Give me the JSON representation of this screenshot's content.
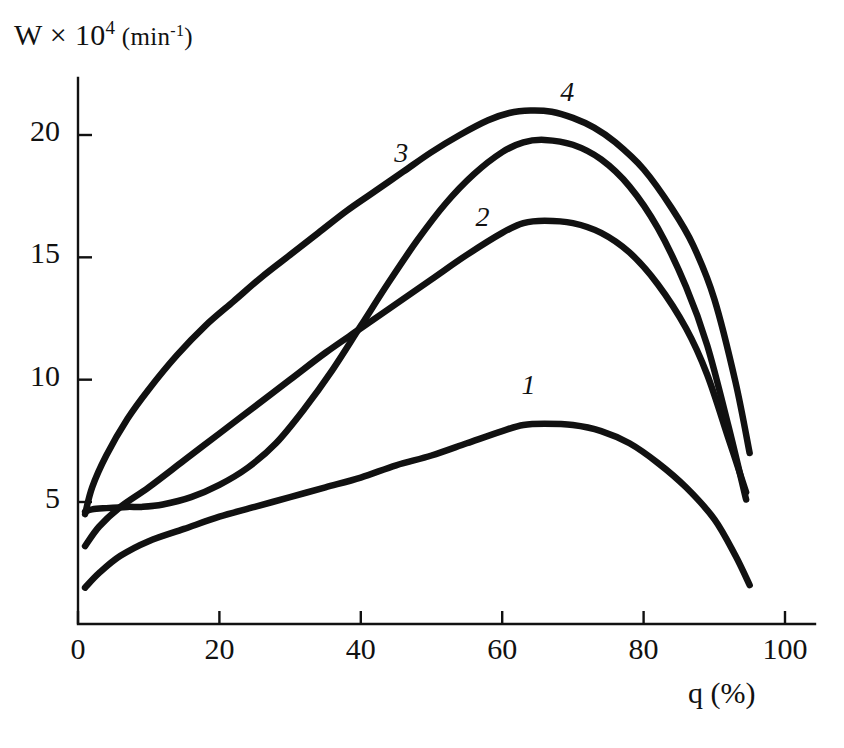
{
  "chart_data": {
    "type": "line",
    "title": "",
    "ylabel": "W x 10^4 (min^-1)",
    "ylabel_parts": {
      "lead": "W × 10",
      "exp": "4",
      "unit_open": " (min",
      "unit_exp": "-1",
      "unit_close": ")"
    },
    "xlabel": "q (%)",
    "xlim": [
      0,
      100
    ],
    "ylim": [
      0,
      22.3
    ],
    "grid": false,
    "legend": "inline-curve-numbers",
    "xticks": [
      0,
      20,
      40,
      60,
      80,
      100
    ],
    "xtick_labels": [
      "0",
      "20",
      "40",
      "60",
      "80",
      "100"
    ],
    "yticks": [
      5,
      10,
      15,
      20
    ],
    "ytick_labels": [
      "5",
      "10",
      "15",
      "20"
    ],
    "series": [
      {
        "name": "1",
        "label": "1",
        "label_x": 64,
        "label_y": 9.6,
        "x": [
          1,
          3,
          6,
          10,
          15,
          20,
          25,
          30,
          35,
          40,
          45,
          50,
          55,
          60,
          63,
          66,
          70,
          74,
          78,
          82,
          86,
          90,
          93,
          95
        ],
        "y": [
          1.5,
          2.1,
          2.8,
          3.4,
          3.9,
          4.4,
          4.8,
          5.2,
          5.6,
          6.0,
          6.5,
          6.9,
          7.4,
          7.9,
          8.15,
          8.2,
          8.15,
          7.9,
          7.4,
          6.6,
          5.6,
          4.3,
          2.8,
          1.6
        ]
      },
      {
        "name": "2",
        "label": "2",
        "label_x": 57.5,
        "label_y": 16.5,
        "x": [
          1,
          3,
          6,
          10,
          15,
          20,
          25,
          30,
          35,
          40,
          45,
          50,
          55,
          60,
          63,
          66,
          70,
          74,
          78,
          82,
          86,
          89,
          92,
          94.5
        ],
        "y": [
          3.2,
          4.0,
          4.8,
          5.6,
          6.7,
          7.8,
          8.9,
          10.0,
          11.1,
          12.1,
          13.1,
          14.1,
          15.1,
          16.0,
          16.4,
          16.5,
          16.4,
          16.0,
          15.2,
          13.9,
          12.1,
          10.2,
          7.6,
          5.4
        ]
      },
      {
        "name": "3",
        "label": "3",
        "label_x": 46,
        "label_y": 19.1,
        "x": [
          1,
          2,
          4,
          7,
          9,
          12,
          16,
          20,
          24,
          28,
          32,
          36,
          40,
          44,
          48,
          52,
          56,
          60,
          63,
          66,
          70,
          74,
          78,
          82,
          86,
          89,
          92,
          94.5
        ],
        "y": [
          4.6,
          4.7,
          4.75,
          4.8,
          4.8,
          4.9,
          5.2,
          5.7,
          6.4,
          7.4,
          8.8,
          10.4,
          12.2,
          14.0,
          15.7,
          17.2,
          18.4,
          19.3,
          19.7,
          19.8,
          19.6,
          19.0,
          17.9,
          16.2,
          13.8,
          11.4,
          8.1,
          5.1
        ]
      },
      {
        "name": "4",
        "label": "4",
        "label_x": 69.5,
        "label_y": 21.6,
        "x": [
          1,
          2,
          4,
          7,
          10,
          14,
          18,
          22,
          26,
          30,
          34,
          38,
          42,
          46,
          50,
          54,
          58,
          61,
          64,
          67,
          70,
          73,
          76,
          80,
          84,
          87,
          90,
          93,
          95
        ],
        "y": [
          4.5,
          5.6,
          6.9,
          8.4,
          9.6,
          11.0,
          12.2,
          13.2,
          14.2,
          15.1,
          16.0,
          16.9,
          17.7,
          18.5,
          19.3,
          20.0,
          20.6,
          20.9,
          21.0,
          20.95,
          20.7,
          20.3,
          19.7,
          18.6,
          17.0,
          15.5,
          13.3,
          9.9,
          7.0
        ]
      }
    ]
  },
  "axes": {
    "x_axis_name": "x-axis",
    "y_axis_name": "y-axis"
  }
}
